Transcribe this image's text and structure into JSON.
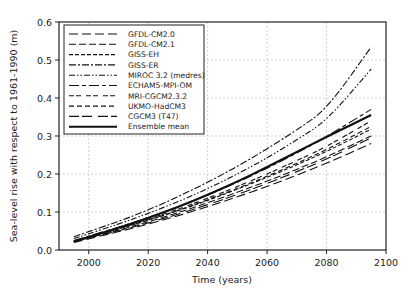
{
  "chart_data": {
    "type": "line",
    "title": "",
    "xlabel": "Time (years)",
    "ylabel": "Sea-level rise with respect to 1961-1990 (m)",
    "xlim": [
      1990,
      2100
    ],
    "ylim": [
      0.0,
      0.6
    ],
    "xticks": [
      2000,
      2020,
      2040,
      2060,
      2080,
      2100
    ],
    "yticks": [
      0.0,
      0.1,
      0.2,
      0.3,
      0.4,
      0.5,
      0.6
    ],
    "ytick_labels": [
      "0.0",
      "0.1",
      "0.2",
      "0.3",
      "0.4",
      "0.5",
      "0.6"
    ],
    "grid": true,
    "legend_position": "upper left",
    "x": [
      1995,
      2010,
      2020,
      2030,
      2040,
      2050,
      2060,
      2070,
      2080,
      2095
    ],
    "series": [
      {
        "name": "GFDL-CM2.0",
        "dash": "9,4",
        "values": [
          0.02,
          0.048,
          0.068,
          0.09,
          0.114,
          0.14,
          0.167,
          0.197,
          0.228,
          0.28
        ]
      },
      {
        "name": "GFDL-CM2.1",
        "dash": "7,3",
        "values": [
          0.022,
          0.052,
          0.074,
          0.098,
          0.124,
          0.152,
          0.181,
          0.212,
          0.245,
          0.3
        ]
      },
      {
        "name": "GISS-EH",
        "dash": "4,2",
        "values": [
          0.022,
          0.055,
          0.078,
          0.103,
          0.13,
          0.16,
          0.191,
          0.224,
          0.259,
          0.318
        ]
      },
      {
        "name": "GISS-ER",
        "dash": "7,2,2,2",
        "values": [
          0.035,
          0.075,
          0.105,
          0.14,
          0.178,
          0.22,
          0.266,
          0.316,
          0.37,
          0.534
        ]
      },
      {
        "name": "MIROC 3.2 (medres)",
        "dash": "6,2,1.5,2,1.5,2",
        "values": [
          0.03,
          0.068,
          0.096,
          0.127,
          0.161,
          0.2,
          0.242,
          0.29,
          0.34,
          0.476
        ]
      },
      {
        "name": "ECHAM5-MPI-OM",
        "dash": "10,3,4,3",
        "values": [
          0.025,
          0.06,
          0.085,
          0.113,
          0.144,
          0.178,
          0.215,
          0.255,
          0.298,
          0.37
        ]
      },
      {
        "name": "MRI-CGCM2.3.2",
        "dash": "5,2,5,5",
        "values": [
          0.023,
          0.057,
          0.081,
          0.107,
          0.136,
          0.167,
          0.2,
          0.235,
          0.272,
          0.34
        ]
      },
      {
        "name": "UKMO-HadCM3",
        "dash": "5,3",
        "values": [
          0.024,
          0.056,
          0.079,
          0.104,
          0.132,
          0.162,
          0.194,
          0.228,
          0.264,
          0.325
        ]
      },
      {
        "name": "CGCM3 (T47)",
        "dash": "10,3,10,6",
        "values": [
          0.022,
          0.05,
          0.071,
          0.094,
          0.119,
          0.146,
          0.175,
          0.206,
          0.239,
          0.295
        ]
      },
      {
        "name": "Ensemble mean",
        "dash": "",
        "values": [
          0.022,
          0.058,
          0.084,
          0.113,
          0.145,
          0.18,
          0.218,
          0.258,
          0.298,
          0.355
        ],
        "bold": true
      }
    ]
  }
}
